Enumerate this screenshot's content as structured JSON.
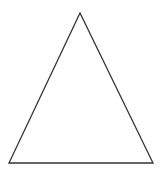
{
  "diagram": {
    "shape": "triangle",
    "type": "isosceles",
    "vertices": [
      [
        80,
        13
      ],
      [
        9,
        163
      ],
      [
        153,
        163
      ]
    ],
    "stroke_color": "#333333",
    "fill_color": "#ffffff",
    "stroke_width": 1.3
  }
}
